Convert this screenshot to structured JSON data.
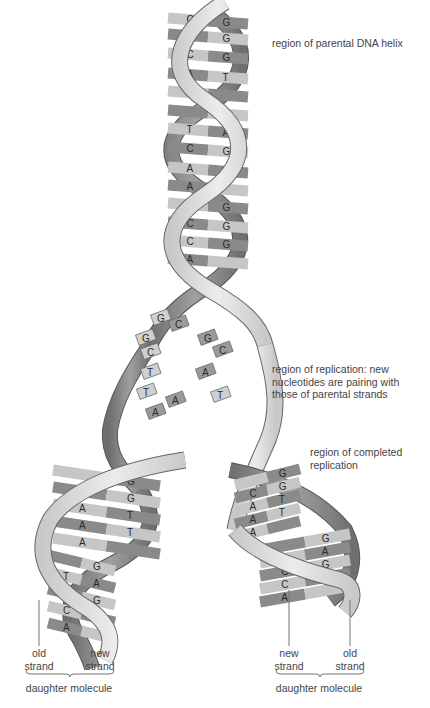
{
  "diagram": {
    "colors": {
      "backbone_light": "#d9d9d9",
      "backbone_dark": "#8c8c8c",
      "rung_light": "#c8c8c8",
      "rung_dark": "#8a8a8a",
      "outline": "#555555",
      "text": "#444444",
      "background": "#ffffff"
    },
    "annotations": [
      {
        "id": "parental",
        "text": "region of parental DNA helix"
      },
      {
        "id": "replication",
        "lines": [
          "region of replication: new",
          "nucleotides are pairing with",
          "those of parental strands"
        ]
      },
      {
        "id": "completed",
        "lines": [
          "region of completed",
          "replication"
        ]
      }
    ],
    "parental_helix_pairs": [
      {
        "left": "C",
        "right": "G"
      },
      {
        "left": "C",
        "right": "G"
      },
      {
        "left": "C",
        "right": "G"
      },
      {
        "left": "A",
        "right": "T"
      },
      {
        "left": "A",
        "right": ""
      },
      {
        "left": "",
        "right": "G"
      },
      {
        "left": "T",
        "right": "A"
      },
      {
        "left": "C",
        "right": "G"
      },
      {
        "left": "A",
        "right": "T"
      },
      {
        "left": "A",
        "right": ""
      },
      {
        "left": "",
        "right": "G"
      },
      {
        "left": "C",
        "right": "G"
      },
      {
        "left": "C",
        "right": "G"
      },
      {
        "left": "A",
        "right": ""
      }
    ],
    "fork_free_bases": [
      "G",
      "C",
      "G",
      "G",
      "C",
      "C",
      "T",
      "A",
      "T",
      "A",
      "T",
      "A"
    ],
    "left_daughter_pairs": [
      {
        "left": "",
        "right": "G"
      },
      {
        "left": "C",
        "right": "G"
      },
      {
        "left": "A",
        "right": "T"
      },
      {
        "left": "A",
        "right": "T"
      },
      {
        "left": "A",
        "right": ""
      },
      {
        "left": "",
        "right": "G"
      },
      {
        "left": "T",
        "right": "A"
      },
      {
        "left": "C",
        "right": "G"
      },
      {
        "left": "C",
        "right": "G"
      },
      {
        "left": "A",
        "right": ""
      }
    ],
    "right_daughter_pairs": [
      {
        "left": "",
        "right": "G"
      },
      {
        "left": "C",
        "right": "G"
      },
      {
        "left": "A",
        "right": "T"
      },
      {
        "left": "A",
        "right": "T"
      },
      {
        "left": "A",
        "right": ""
      },
      {
        "left": "",
        "right": "G"
      },
      {
        "left": "T",
        "right": "A"
      },
      {
        "left": "C",
        "right": "G"
      },
      {
        "left": "C",
        "right": "G"
      },
      {
        "left": "A",
        "right": ""
      }
    ],
    "left_molecule": {
      "strand_left": [
        "old",
        "strand"
      ],
      "strand_right": [
        "new",
        "strand"
      ],
      "label": "daughter molecule"
    },
    "right_molecule": {
      "strand_left": [
        "new",
        "strand"
      ],
      "strand_right": [
        "old",
        "strand"
      ],
      "label": "daughter molecule"
    }
  }
}
